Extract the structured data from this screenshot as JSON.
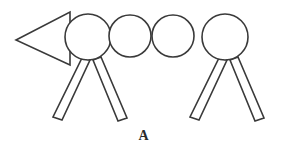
{
  "figure": {
    "label": "A",
    "caption": "A",
    "background_color": "#ffffff",
    "stroke_color": "#3a3a3a",
    "fill_color": "#ffffff",
    "stroke_width": 1.6,
    "canvas": {
      "width": 287,
      "height": 148
    },
    "shapes": {
      "head": {
        "name": "triangle-head",
        "type": "triangle",
        "direction": "left",
        "points": "70,12 70,65 16,40",
        "apex": {
          "x": 16,
          "y": 40
        },
        "base_top": {
          "x": 70,
          "y": 12
        },
        "base_bottom": {
          "x": 70,
          "y": 65
        }
      },
      "segments": [
        {
          "name": "body-circle-1",
          "cx": 88,
          "cy": 37,
          "r": 23
        },
        {
          "name": "body-circle-2",
          "cx": 130,
          "cy": 36,
          "r": 21
        },
        {
          "name": "body-circle-3",
          "cx": 173,
          "cy": 36,
          "r": 21
        },
        {
          "name": "body-circle-4",
          "cx": 225,
          "cy": 37,
          "r": 23
        }
      ],
      "legs": [
        {
          "name": "leg-front-left",
          "points": "82,58 90,60 62,120 53,117",
          "group": "front"
        },
        {
          "name": "leg-front-right",
          "points": "93,60 101,57 127,118 118,121",
          "group": "front"
        },
        {
          "name": "leg-rear-left",
          "points": "219,58 227,60 199,120 190,117",
          "group": "rear"
        },
        {
          "name": "leg-rear-right",
          "points": "230,60 238,57 264,118 255,121",
          "group": "rear"
        }
      ]
    }
  }
}
